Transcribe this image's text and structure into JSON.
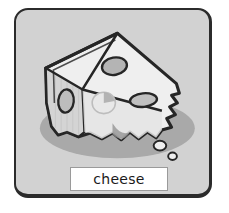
{
  "card": {
    "label": "cheese",
    "illustration_name": "cheese-wedge",
    "colors": {
      "card_background": "#d2d2d2",
      "card_border": "#2b2b2b",
      "label_background": "#ffffff",
      "label_border": "#9a9a9a",
      "label_text": "#1a1a1a",
      "cheese_top": "#f2f2f2",
      "cheese_front": "#e2e2e2",
      "cheese_side": "#cfcfcf",
      "cheese_outline": "#262626",
      "hole_fill": "#b8b8b8",
      "shadow": "#a8a8a8",
      "crumb_fill": "#efefef"
    }
  },
  "illustration": {
    "shadow_ellipse": {
      "cx": 108,
      "cy": 128,
      "rx": 82,
      "ry": 32
    },
    "holes": [
      {
        "name": "hole-top-right",
        "cx": 103,
        "cy": 63,
        "rx": 13,
        "ry": 9,
        "rotate": -8
      },
      {
        "name": "hole-mid-right",
        "cx": 133,
        "cy": 98,
        "rx": 14,
        "ry": 7,
        "rotate": -6
      },
      {
        "name": "hole-left-face",
        "cx": 54,
        "cy": 98,
        "rx": 8,
        "ry": 12,
        "rotate": 6
      },
      {
        "name": "hole-front-center",
        "cx": 92,
        "cy": 100,
        "rx": 12,
        "ry": 11,
        "rotate": 0
      }
    ],
    "crumbs": [
      {
        "name": "crumb-large",
        "cx": 152,
        "cy": 145,
        "rx": 6,
        "ry": 5
      },
      {
        "name": "crumb-small",
        "cx": 164,
        "cy": 155,
        "rx": 4,
        "ry": 3.5
      }
    ]
  }
}
